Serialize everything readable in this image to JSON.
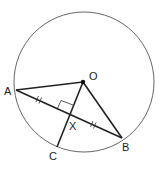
{
  "diagram": {
    "colors": {
      "stroke": "#222222",
      "circle": "#555555",
      "background": "#ffffff"
    },
    "circle": {
      "center": "O",
      "cx": 84,
      "cy": 82,
      "r": 70
    },
    "points": {
      "O": {
        "label": "O",
        "x": 83,
        "y": 82
      },
      "A": {
        "label": "A",
        "x": 16,
        "y": 90
      },
      "B": {
        "label": "B",
        "x": 122,
        "y": 138
      },
      "C": {
        "label": "C",
        "x": 57,
        "y": 147
      },
      "X": {
        "label": "X",
        "x": 69,
        "y": 115
      }
    },
    "segments": [
      "OA",
      "OB",
      "AB",
      "OC"
    ],
    "markings": [
      "right angle at X between OC and AB",
      "AX = XB (double tick marks)"
    ]
  }
}
